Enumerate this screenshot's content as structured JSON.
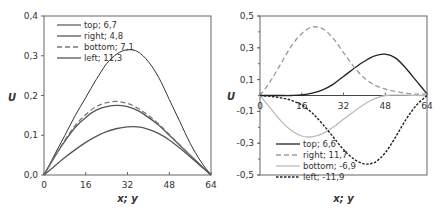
{
  "chart_data": [
    {
      "type": "line",
      "title": "",
      "xlabel": "x; y",
      "ylabel": "U",
      "xlim": [
        0,
        64
      ],
      "ylim": [
        0.0,
        0.4
      ],
      "xticks": [
        "0",
        "16",
        "32",
        "48",
        "64"
      ],
      "yticks": [
        "0,0",
        "0,1",
        "0,2",
        "0,3",
        "0,4"
      ],
      "grid": false,
      "legend_position": "upper-left",
      "x": [
        0,
        4,
        8,
        12,
        16,
        20,
        24,
        28,
        32,
        36,
        40,
        44,
        48,
        52,
        56,
        60,
        64
      ],
      "series": [
        {
          "name": "top; 6,7",
          "style": "solid-thin",
          "color": "#333333",
          "values": [
            0.0,
            0.05,
            0.1,
            0.15,
            0.195,
            0.24,
            0.28,
            0.305,
            0.315,
            0.31,
            0.285,
            0.245,
            0.19,
            0.135,
            0.08,
            0.035,
            0.0
          ]
        },
        {
          "name": "right; 4,8",
          "style": "solid",
          "color": "#555555",
          "values": [
            0.0,
            0.045,
            0.085,
            0.12,
            0.145,
            0.163,
            0.172,
            0.175,
            0.172,
            0.162,
            0.145,
            0.125,
            0.1,
            0.075,
            0.05,
            0.025,
            0.0
          ]
        },
        {
          "name": "bottom; 7,1",
          "style": "dashed",
          "color": "#777777",
          "values": [
            0.0,
            0.045,
            0.088,
            0.125,
            0.152,
            0.172,
            0.182,
            0.185,
            0.18,
            0.168,
            0.15,
            0.128,
            0.102,
            0.076,
            0.05,
            0.025,
            0.0
          ]
        },
        {
          "name": "left; 11,3",
          "style": "solid",
          "color": "#555555",
          "values": [
            0.0,
            0.022,
            0.044,
            0.064,
            0.082,
            0.097,
            0.109,
            0.117,
            0.121,
            0.121,
            0.115,
            0.104,
            0.088,
            0.068,
            0.046,
            0.023,
            0.0
          ]
        }
      ]
    },
    {
      "type": "line",
      "title": "",
      "xlabel": "x; y",
      "ylabel": "U",
      "xlim": [
        0,
        64
      ],
      "ylim": [
        -0.5,
        0.5
      ],
      "xticks": [
        "0",
        "16",
        "32",
        "48",
        "64"
      ],
      "yticks": [
        "0,5",
        "0,3",
        "0,1",
        "-0,1",
        "-0,3",
        "-0,5"
      ],
      "grid": false,
      "legend_position": "lower-left",
      "x": [
        0,
        4,
        8,
        12,
        16,
        20,
        24,
        28,
        32,
        36,
        40,
        44,
        48,
        52,
        56,
        60,
        64
      ],
      "series": [
        {
          "name": "top; 6,6",
          "style": "solid",
          "color": "#222222",
          "values": [
            0.0,
            0.0,
            0.0,
            0.0,
            0.003,
            0.015,
            0.035,
            0.07,
            0.12,
            0.17,
            0.215,
            0.25,
            0.26,
            0.235,
            0.17,
            0.09,
            0.01
          ]
        },
        {
          "name": "right; 11,7",
          "style": "dashed",
          "color": "#999999",
          "values": [
            0.0,
            0.09,
            0.2,
            0.31,
            0.39,
            0.43,
            0.42,
            0.36,
            0.27,
            0.18,
            0.11,
            0.065,
            0.04,
            0.025,
            0.015,
            0.008,
            0.01
          ]
        },
        {
          "name": "bottom; -6,9",
          "style": "solid",
          "color": "#bbbbbb",
          "values": [
            0.0,
            -0.08,
            -0.16,
            -0.22,
            -0.255,
            -0.26,
            -0.24,
            -0.2,
            -0.15,
            -0.1,
            -0.055,
            -0.02,
            0.0,
            0.002,
            0.002,
            0.001,
            0.0
          ]
        },
        {
          "name": "left; -11,9",
          "style": "dotted",
          "color": "#222222",
          "values": [
            0.0,
            -0.005,
            -0.015,
            -0.03,
            -0.06,
            -0.11,
            -0.18,
            -0.26,
            -0.34,
            -0.4,
            -0.43,
            -0.42,
            -0.36,
            -0.26,
            -0.15,
            -0.06,
            0.0
          ]
        }
      ]
    }
  ]
}
